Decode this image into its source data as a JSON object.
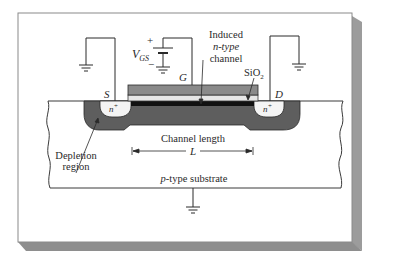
{
  "figure": {
    "labels": {
      "vgs_main": "V",
      "vgs_sub": "GS",
      "plus": "+",
      "minus": "−",
      "gate": "G",
      "source": "S",
      "drain": "D",
      "induced_1": "Induced",
      "induced_2": "n-type",
      "induced_3": "channel",
      "sio2_main": "SiO",
      "sio2_sub": "2",
      "nplus_left": "n",
      "nplus_right": "n",
      "nplus_sup": "+",
      "channel_length": "Channel length",
      "L": "L",
      "depletion_1": "Depletion",
      "depletion_2": "region",
      "substrate_p": "p",
      "substrate_rest": "-type substrate"
    },
    "colors": {
      "background": "#ffffff",
      "frame_border": "#7a7a7a",
      "frame_shadow": "#9a9a9a",
      "gate": "#8a8a8a",
      "oxide": "#e6e6e6",
      "channel": "#111111",
      "depletion": "#5e5e5e",
      "nplus": "#f4f4f4",
      "line": "#2a2a2a"
    }
  }
}
